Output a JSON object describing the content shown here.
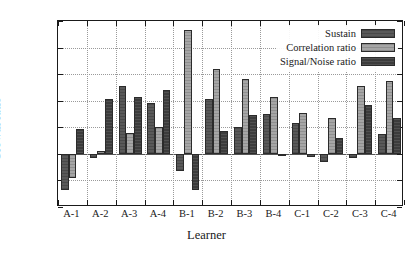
{
  "chart_data": {
    "type": "bar",
    "title": "",
    "xlabel": "Learner",
    "ylabel": "Growth ratio",
    "categories": [
      "A-1",
      "A-2",
      "A-3",
      "A-4",
      "B-1",
      "B-2",
      "B-3",
      "B-4",
      "C-1",
      "C-2",
      "C-3",
      "C-4"
    ],
    "ylim": [
      -0.4,
      1.0
    ],
    "yticks": [
      "1",
      "0.8",
      "0.6",
      "0.4",
      "0.2",
      "0",
      "-0.2",
      "-0.4"
    ],
    "ytick_values": [
      1,
      0.8,
      0.6,
      0.4,
      0.2,
      0,
      -0.2,
      -0.4
    ],
    "grid": true,
    "legend_position": "top-right",
    "series": [
      {
        "name": "Sustain",
        "color": "#595959",
        "values": [
          -0.27,
          -0.03,
          0.51,
          0.38,
          -0.13,
          0.41,
          0.2,
          0.3,
          0.23,
          -0.06,
          -0.03,
          0.15
        ]
      },
      {
        "name": "Correlation ratio",
        "color": "#a6a6a6",
        "values": [
          -0.18,
          0.02,
          0.16,
          0.2,
          0.93,
          0.64,
          0.56,
          0.43,
          0.31,
          0.27,
          0.51,
          0.55
        ]
      },
      {
        "name": "Signal/Noise ratio",
        "color": "#3c3c3c",
        "values": [
          0.19,
          0.41,
          0.43,
          0.48,
          -0.27,
          0.17,
          0.29,
          0.0,
          -0.02,
          0.12,
          0.37,
          0.27
        ]
      }
    ]
  }
}
